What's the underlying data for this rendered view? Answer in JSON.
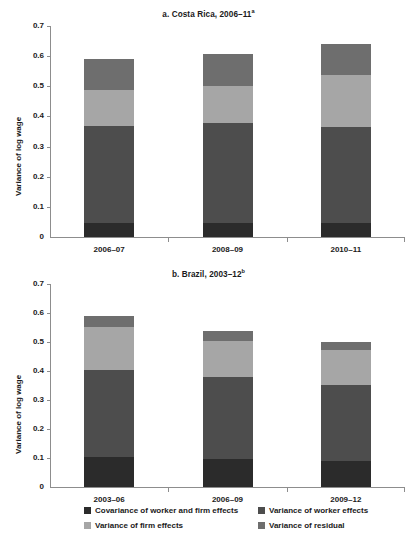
{
  "figure": {
    "ylabel": "Variance of log wage"
  },
  "legend": {
    "items": [
      {
        "label": "Covariance of worker and firm effects",
        "color": "#2b2b2b",
        "key": "covariance"
      },
      {
        "label": "Variance of worker effects",
        "color": "#4d4d4d",
        "key": "worker"
      },
      {
        "label": "Variance of firm effects",
        "color": "#a6a6a6",
        "key": "firm"
      },
      {
        "label": "Variance of residual",
        "color": "#6e6e6e",
        "key": "residual"
      }
    ]
  },
  "chart_data": [
    {
      "type": "bar",
      "id": "panel-a",
      "title": "a. Costa Rica, 2006–11",
      "title_superscript": "a",
      "stacked": true,
      "xlabel": "",
      "ylabel": "Variance of log wage",
      "ylim": [
        0,
        0.7
      ],
      "yticks": [
        0,
        0.1,
        0.2,
        0.3,
        0.4,
        0.5,
        0.6,
        0.7
      ],
      "ytick_labels": [
        "0",
        "0.1",
        "0.2",
        "0.3",
        "0.4",
        "0.5",
        "0.6",
        "0.7"
      ],
      "grid": false,
      "legend_position": "bottom",
      "categories": [
        "2006–07",
        "2008–09",
        "2010–11"
      ],
      "series": [
        {
          "name": "Covariance of worker and firm effects",
          "color": "#2b2b2b",
          "values": [
            0.047,
            0.048,
            0.045
          ]
        },
        {
          "name": "Variance of worker effects",
          "color": "#4d4d4d",
          "values": [
            0.32,
            0.331,
            0.319
          ]
        },
        {
          "name": "Variance of firm effects",
          "color": "#a6a6a6",
          "values": [
            0.122,
            0.122,
            0.173
          ]
        },
        {
          "name": "Variance of residual",
          "color": "#6e6e6e",
          "values": [
            0.103,
            0.105,
            0.102
          ]
        }
      ],
      "totals": [
        0.592,
        0.606,
        0.639
      ]
    },
    {
      "type": "bar",
      "id": "panel-b",
      "title": "b. Brazil, 2003–12",
      "title_superscript": "b",
      "stacked": true,
      "xlabel": "",
      "ylabel": "Variance of log wage",
      "ylim": [
        0,
        0.7
      ],
      "yticks": [
        0,
        0.1,
        0.2,
        0.3,
        0.4,
        0.5,
        0.6,
        0.7
      ],
      "ytick_labels": [
        "0",
        "0.1",
        "0.2",
        "0.3",
        "0.4",
        "0.5",
        "0.6",
        "0.7"
      ],
      "grid": false,
      "legend_position": "bottom",
      "categories": [
        "2003–06",
        "2006–09",
        "2009–12"
      ],
      "series": [
        {
          "name": "Covariance of worker and firm effects",
          "color": "#2b2b2b",
          "values": [
            0.105,
            0.098,
            0.088
          ]
        },
        {
          "name": "Variance of worker effects",
          "color": "#4d4d4d",
          "values": [
            0.3,
            0.281,
            0.265
          ]
        },
        {
          "name": "Variance of firm effects",
          "color": "#a6a6a6",
          "values": [
            0.146,
            0.126,
            0.118
          ]
        },
        {
          "name": "Variance of residual",
          "color": "#6e6e6e",
          "values": [
            0.039,
            0.034,
            0.029
          ]
        }
      ],
      "totals": [
        0.59,
        0.539,
        0.5
      ]
    }
  ]
}
